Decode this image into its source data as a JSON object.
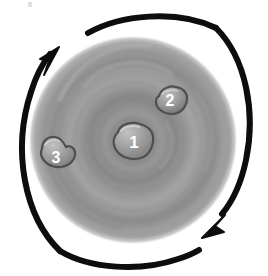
{
  "figure": {
    "background_color": "#ffffff"
  },
  "disc": {
    "name": "rotating-disc",
    "center_x": 133,
    "center_y": 140,
    "radius": 101,
    "rings": [
      {
        "r": 101,
        "color": "#a8a8a8"
      },
      {
        "r": 96,
        "color": "#9d9d9d"
      },
      {
        "r": 90,
        "color": "#959595"
      },
      {
        "r": 84,
        "color": "#8d8d8d"
      },
      {
        "r": 78,
        "color": "#939393"
      },
      {
        "r": 72,
        "color": "#9b9b9b"
      },
      {
        "r": 66,
        "color": "#a2a2a2"
      },
      {
        "r": 60,
        "color": "#9a9a9a"
      },
      {
        "r": 53,
        "color": "#909090"
      },
      {
        "r": 46,
        "color": "#888888"
      },
      {
        "r": 39,
        "color": "#8e8e8e"
      },
      {
        "r": 32,
        "color": "#969696"
      },
      {
        "r": 25,
        "color": "#8c8c8c"
      },
      {
        "r": 18,
        "color": "#858585"
      },
      {
        "r": 11,
        "color": "#8a8a8a"
      }
    ]
  },
  "markers": [
    {
      "id": "marker-1",
      "label": "1",
      "cx": 133,
      "cy": 142,
      "rx": 20,
      "ry": 15,
      "fill": "#9e9e9e",
      "stroke": "#4f4f4f",
      "position_description": "center of disc"
    },
    {
      "id": "marker-2",
      "label": "2",
      "cx": 171,
      "cy": 101,
      "rx": 16,
      "ry": 13,
      "fill": "#9a9a9a",
      "stroke": "#4f4f4f",
      "position_description": "upper right of disc"
    },
    {
      "id": "marker-3",
      "label": "3",
      "cx": 55,
      "cy": 154,
      "rx": 16,
      "ry": 13,
      "fill": "#a0a0a0",
      "stroke": "#4f4f4f",
      "position_description": "left side of disc"
    }
  ],
  "arrows": [
    {
      "id": "arrow-upper-left",
      "direction": "counterclockwise",
      "head_position": "upper-left",
      "head_points": "up-right",
      "color": "#0d0d0d",
      "stroke_width": 6
    },
    {
      "id": "arrow-lower-right",
      "direction": "counterclockwise",
      "head_position": "lower-right",
      "head_points": "down-left",
      "color": "#0d0d0d",
      "stroke_width": 6
    }
  ],
  "colors": {
    "arrow": "#0d0d0d",
    "label_text": "#ffffff",
    "blob_outline": "#4f4f4f",
    "disc_outer": "#a8a8a8",
    "disc_inner": "#858585"
  },
  "artifact": {
    "name": "scan-speck",
    "x": 28,
    "y": 2,
    "color": "#c9c9c9"
  }
}
